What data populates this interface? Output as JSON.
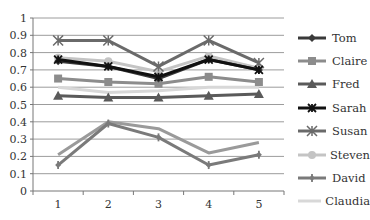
{
  "chart_data": {
    "type": "line",
    "title": "",
    "xlabel": "",
    "ylabel": "",
    "categories": [
      "1",
      "2",
      "3",
      "4",
      "5"
    ],
    "ylim": [
      0,
      1
    ],
    "yticks": [
      "0",
      "0.1",
      "0.2",
      "0.3",
      "0.4",
      "0.5",
      "0.6",
      "0.7",
      "0.8",
      "0.9",
      "1"
    ],
    "grid": true,
    "legend_position": "right",
    "series": [
      {
        "name": "Tom",
        "color": "#3a3a3a",
        "marker": "diamond",
        "values": [
          0.75,
          0.72,
          0.65,
          0.76,
          0.7
        ]
      },
      {
        "name": "Claire",
        "color": "#8c8c8c",
        "marker": "square",
        "values": [
          0.65,
          0.63,
          0.62,
          0.66,
          0.63
        ]
      },
      {
        "name": "Fred",
        "color": "#5a5a5a",
        "marker": "triangle",
        "values": [
          0.55,
          0.54,
          0.54,
          0.55,
          0.56
        ]
      },
      {
        "name": "Sarah",
        "color": "#111111",
        "marker": "star",
        "values": [
          0.76,
          0.72,
          0.66,
          0.76,
          0.7
        ]
      },
      {
        "name": "Susan",
        "color": "#6a6a6a",
        "marker": "asterisk",
        "values": [
          0.87,
          0.87,
          0.72,
          0.87,
          0.74
        ]
      },
      {
        "name": "Steven",
        "color": "#c4c4c4",
        "marker": "circle",
        "values": [
          0.77,
          0.75,
          0.69,
          0.78,
          0.71
        ]
      },
      {
        "name": "David",
        "color": "#7a7a7a",
        "marker": "plus",
        "values": [
          0.15,
          0.39,
          0.31,
          0.15,
          0.21
        ]
      },
      {
        "name": "Claudia",
        "color": "#d8d8d8",
        "marker": "none",
        "values": [
          0.6,
          0.57,
          0.58,
          0.6,
          0.6
        ]
      },
      {
        "name": "Ben",
        "color": "#9a9a9a",
        "marker": "none",
        "values": [
          0.21,
          0.4,
          0.36,
          0.22,
          0.28
        ]
      }
    ]
  },
  "legend": {
    "items": [
      "Tom",
      "Claire",
      "Fred",
      "Sarah",
      "Susan",
      "Steven",
      "David",
      "Claudia",
      "Ben"
    ]
  }
}
